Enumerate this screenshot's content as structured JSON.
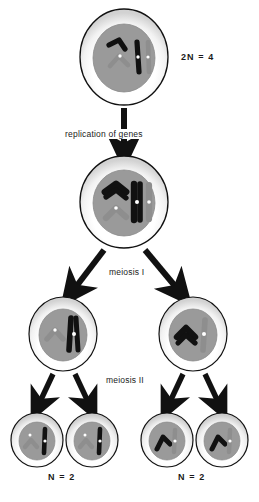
{
  "diagram": {
    "background_color": "#ffffff",
    "ink_color": "#111111",
    "cytoplasm_color": "#ffffff",
    "cytoplasm_edge_color": "#000000",
    "nucleus_color": "#9a9a9a",
    "chromosome_dark_color": "#000000",
    "chromosome_light_color": "#8e8e8e",
    "centromere_color": "#ffffff",
    "stipple_color": "#c9c9c9"
  },
  "labels": {
    "replication": "replication of genes",
    "meiosis_one": "meiosis I",
    "meiosis_two": "meiosis II",
    "ploidy_parent": "2N = 4",
    "ploidy_daughter_left": "N = 2",
    "ploidy_daughter_right": "N = 2"
  },
  "cells": {
    "parent": {
      "name": "parent-cell",
      "ploidy": "2N = 4",
      "chromosome_count": 4,
      "replicated": false,
      "cx": 124,
      "cy": 57,
      "rx": 44,
      "ry": 48
    },
    "replicated": {
      "name": "replicated-cell",
      "chromosome_count": 4,
      "replicated": true,
      "cx": 124,
      "cy": 202,
      "rx": 44,
      "ry": 46
    },
    "meiosis_one_products": [
      {
        "name": "daughter-cell-left",
        "chromosome_count": 2,
        "replicated": true,
        "cx": 63,
        "cy": 334,
        "rx": 34,
        "ry": 37
      },
      {
        "name": "daughter-cell-right",
        "chromosome_count": 2,
        "replicated": true,
        "cx": 193,
        "cy": 334,
        "rx": 34,
        "ry": 37
      }
    ],
    "meiosis_two_products": [
      {
        "name": "gamete-cell-1",
        "chromosome_count": 2,
        "replicated": false,
        "cx": 37,
        "cy": 440,
        "rx": 26,
        "ry": 27
      },
      {
        "name": "gamete-cell-2",
        "chromosome_count": 2,
        "replicated": false,
        "cx": 92,
        "cy": 440,
        "rx": 26,
        "ry": 27
      },
      {
        "name": "gamete-cell-3",
        "chromosome_count": 2,
        "replicated": false,
        "cx": 167,
        "cy": 440,
        "rx": 26,
        "ry": 27
      },
      {
        "name": "gamete-cell-4",
        "chromosome_count": 2,
        "replicated": false,
        "cx": 222,
        "cy": 440,
        "rx": 26,
        "ry": 27
      }
    ]
  },
  "arrows": {
    "replication": {
      "name": "replication-arrow",
      "from_cy": 108,
      "to_cy": 155
    },
    "meiosis_one": [
      {
        "name": "meiosis-one-arrow-left"
      },
      {
        "name": "meiosis-one-arrow-right"
      }
    ],
    "meiosis_two": [
      {
        "name": "meiosis-two-arrow-1"
      },
      {
        "name": "meiosis-two-arrow-2"
      },
      {
        "name": "meiosis-two-arrow-3"
      },
      {
        "name": "meiosis-two-arrow-4"
      }
    ]
  }
}
